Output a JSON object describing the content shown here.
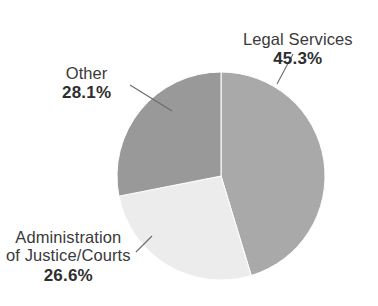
{
  "chart_data": {
    "type": "pie",
    "title": "",
    "subtitle": "",
    "xlabel": "",
    "ylabel": "",
    "legend_position": "none",
    "grid": false,
    "start_angle_deg": 0,
    "direction": "clockwise",
    "categories": [
      "Legal Services",
      "Administration of Justice/Courts",
      "Other"
    ],
    "values": [
      45.3,
      26.6,
      28.1
    ],
    "value_unit": "percent",
    "slices": [
      {
        "name": "Legal Services",
        "label_lines": [
          "Legal Services"
        ],
        "value": 45.3,
        "value_label": "45.3%",
        "color": "#a9a9a9",
        "start_angle_deg": 0,
        "end_angle_deg": 163.08
      },
      {
        "name": "Administration of Justice/Courts",
        "label_lines": [
          "Administration",
          "of Justice/Courts"
        ],
        "value": 26.6,
        "value_label": "26.6%",
        "color": "#ececec",
        "start_angle_deg": 163.08,
        "end_angle_deg": 258.84
      },
      {
        "name": "Other",
        "label_lines": [
          "Other"
        ],
        "value": 28.1,
        "value_label": "28.1%",
        "color": "#999999",
        "start_angle_deg": 258.84,
        "end_angle_deg": 360
      }
    ]
  },
  "labels": {
    "legal_services": {
      "name": "Legal Services",
      "percent": "45.3%"
    },
    "other": {
      "name": "Other",
      "percent": "28.1%"
    },
    "administration": {
      "name_line1": "Administration",
      "name_line2": "of Justice/Courts",
      "percent": "26.6%"
    }
  },
  "colors": {
    "background": "#ffffff",
    "slice_legal_services": "#a9a9a9",
    "slice_administration": "#ececec",
    "slice_other": "#999999",
    "leader_line": "#6b6b6b",
    "text": "#333333"
  }
}
